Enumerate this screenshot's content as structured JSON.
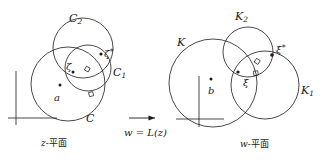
{
  "figure": {
    "stroke_color": "#1a1a1a",
    "background_color": "#ffffff"
  },
  "left_panel": {
    "caption_prefix": "z",
    "caption_dash": "-",
    "caption_plane": "平面",
    "circles": [
      {
        "name": "C",
        "label": "C",
        "cx": 68,
        "cy": 84,
        "r": 37
      },
      {
        "name": "C1",
        "label": "C",
        "sub": "1",
        "cx": 88,
        "cy": 68,
        "r": 23
      },
      {
        "name": "C2",
        "label": "C",
        "sub": "2",
        "cx": 83,
        "cy": 48,
        "r": 30
      }
    ],
    "labels": [
      {
        "name": "circle-label-C2",
        "base": "C",
        "sub": "2",
        "star": "",
        "x": 69,
        "y": 13
      },
      {
        "name": "circle-label-C1",
        "base": "C",
        "sub": "1",
        "star": "",
        "x": 113,
        "y": 67
      },
      {
        "name": "circle-label-C",
        "base": "C",
        "sub": "",
        "star": "",
        "x": 86,
        "y": 113
      },
      {
        "name": "point-label-zeta",
        "base": "ζ",
        "sub": "",
        "star": "",
        "x": 66,
        "y": 62
      },
      {
        "name": "point-label-zeta-star",
        "base": "ζ",
        "sub": "",
        "star": "*",
        "x": 104,
        "y": 48
      },
      {
        "name": "point-label-a",
        "base": "a",
        "sub": "",
        "star": "",
        "x": 54,
        "y": 93
      }
    ],
    "center_point": {
      "name": "a",
      "label": "a",
      "cx": 60,
      "cy": 85
    },
    "axes": {
      "origin_x": 16,
      "origin_y": 118,
      "v_top": 71,
      "h_right": 57
    }
  },
  "transform": {
    "arrow_label": "→",
    "equation_w": "w",
    "equation_eq": " = ",
    "equation_fn": "L(z)",
    "equation_full": "w = L(z)"
  },
  "right_panel": {
    "caption_prefix": "w",
    "caption_dash": "-",
    "caption_plane": "平面",
    "circles": [
      {
        "name": "K",
        "label": "K",
        "cx": 213,
        "cy": 83,
        "r": 44
      },
      {
        "name": "K1",
        "label": "K",
        "sub": "1",
        "cx": 265,
        "cy": 85,
        "r": 34
      },
      {
        "name": "K2",
        "label": "K",
        "sub": "2",
        "cx": 248,
        "cy": 52,
        "r": 25
      }
    ],
    "labels": [
      {
        "name": "circle-label-K2",
        "base": "K",
        "sub": "2",
        "star": "",
        "x": 235,
        "y": 11
      },
      {
        "name": "circle-label-K",
        "base": "K",
        "sub": "",
        "star": "",
        "x": 177,
        "y": 37
      },
      {
        "name": "circle-label-K1",
        "base": "K",
        "sub": "1",
        "star": "",
        "x": 301,
        "y": 85
      },
      {
        "name": "point-label-xi",
        "base": "ξ",
        "sub": "",
        "star": "",
        "x": 243,
        "y": 78
      },
      {
        "name": "point-label-xi-star",
        "base": "ξ",
        "sub": "",
        "star": "*",
        "x": 276,
        "y": 44
      },
      {
        "name": "point-label-b",
        "base": "b",
        "sub": "",
        "star": "",
        "x": 208,
        "y": 86
      }
    ],
    "center_point": {
      "name": "b",
      "label": "b",
      "cx": 211,
      "cy": 79
    },
    "axes": {
      "origin_x": 199,
      "origin_y": 119,
      "v_top": 76,
      "h_right": 224
    }
  }
}
